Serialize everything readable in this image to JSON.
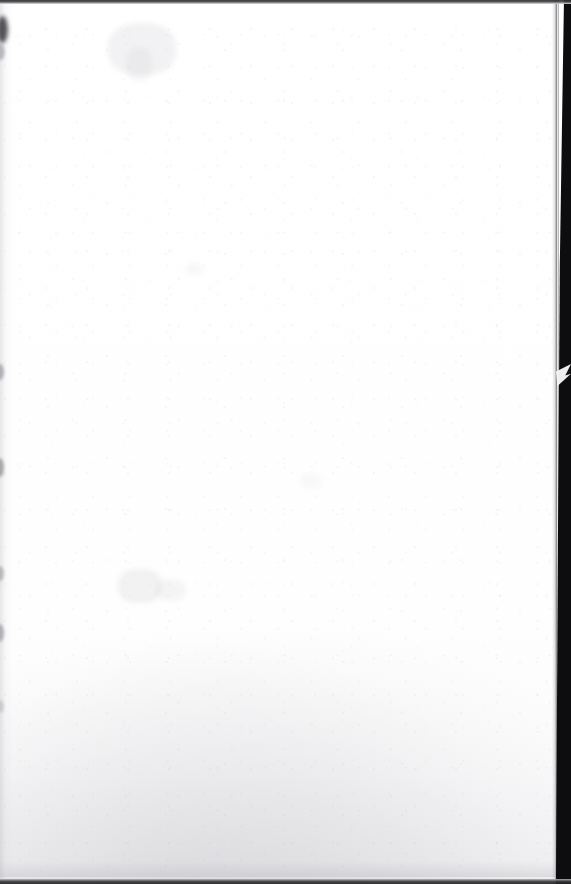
{
  "document": {
    "kind": "scanned-page",
    "content_text": "",
    "page_is_blank": true,
    "width_px": 571,
    "height_px": 884
  },
  "page": {
    "surface_color": "#fefefe",
    "paper_tint_color": "#f4f4f6",
    "right_edge_x_px": 557,
    "top_edge_y_px": 3,
    "bottom_edge_y_px": 879
  },
  "scanner_background": {
    "color": "#0d0d0f",
    "top_band_height_px": 4,
    "bottom_band_height_px": 5,
    "right_band_width_px": 16
  },
  "artifacts": {
    "edge_notch": {
      "name": "torn-corner-notch",
      "y_px": 364,
      "height_px": 22
    },
    "gutter_shadow_color": "#a8a8b0",
    "left_smudges_y_px": [
      18,
      44,
      364,
      458,
      566,
      624,
      700
    ],
    "show_through_regions": [
      {
        "x_px": 108,
        "y_px": 20,
        "w_px": 68,
        "h_px": 52
      },
      {
        "x_px": 118,
        "y_px": 566,
        "w_px": 44,
        "h_px": 34
      }
    ],
    "bottom_mottling": true
  }
}
